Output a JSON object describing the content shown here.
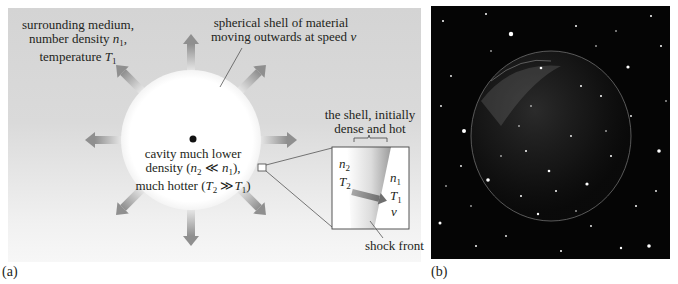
{
  "panel_a": {
    "caption": "(a)",
    "surrounding_label": {
      "line1": "surrounding medium,",
      "line2_text": "number density ",
      "line2_var": "n",
      "line2_sub": "1",
      "line2_end": ",",
      "line3_text": "temperature ",
      "line3_var": "T",
      "line3_sub": "1"
    },
    "shell_label": {
      "line1": "spherical  shell of material",
      "line2_text": "moving outwards at speed ",
      "line2_var": "v"
    },
    "cavity_label": {
      "line1": "cavity much lower",
      "line2_pre": "density (",
      "line2_var_a": "n",
      "line2_sub_a": "2",
      "line2_op": " ≪ ",
      "line2_var_b": "n",
      "line2_sub_b": "1",
      "line2_post": "),",
      "line3_pre": "much hotter (",
      "line3_var_a": "T",
      "line3_sub_a": "2",
      "line3_op": " ≫",
      "line3_var_b": "T",
      "line3_sub_b": "1",
      "line3_post": ")"
    },
    "inset": {
      "title_line1": "the shell, initially",
      "title_line2": "dense and hot",
      "inner_var_n": "n",
      "inner_sub_n": "2",
      "inner_var_t": "T",
      "inner_sub_t": "2",
      "outer_var_n": "n",
      "outer_sub_n": "1",
      "outer_var_t": "T",
      "outer_sub_t": "1",
      "velocity_var": "v",
      "shock_label": "shock front"
    },
    "colors": {
      "background": "#d6d6d6",
      "cavity": "#ffffff",
      "arrow": "#9a9a9a",
      "line": "#555555"
    }
  },
  "panel_b": {
    "caption": "(b)",
    "description": "photograph of expanding spherical shell nebula against star field"
  }
}
